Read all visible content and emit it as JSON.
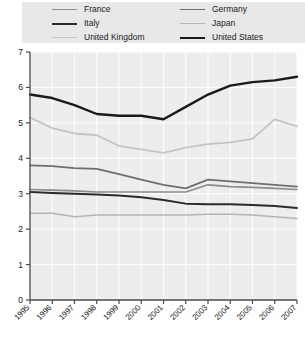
{
  "legend": {
    "columns": [
      [
        {
          "label": "France",
          "color": "#8c8c8c",
          "width": 1.6
        },
        {
          "label": "Italy",
          "color": "#2b2b2b",
          "width": 2.0
        },
        {
          "label": "United Kingdom",
          "color": "#c4c4c4",
          "width": 1.8
        }
      ],
      [
        {
          "label": "Germany",
          "color": "#6e6e6e",
          "width": 1.8
        },
        {
          "label": "Japan",
          "color": "#b5b5b5",
          "width": 1.6
        },
        {
          "label": "United States",
          "color": "#1a1a1a",
          "width": 2.4
        }
      ]
    ],
    "background": "#e8e8e8"
  },
  "axes": {
    "y_ticks": [
      "0",
      "1",
      "2",
      "3",
      "4",
      "5",
      "6",
      "7"
    ],
    "x_ticks": [
      "1995",
      "1996",
      "1997",
      "1998",
      "1999",
      "2000",
      "2001",
      "2002",
      "2003",
      "2004",
      "2005",
      "2006",
      "2007"
    ]
  },
  "chart_data": {
    "type": "line",
    "title": "",
    "xlabel": "",
    "ylabel": "",
    "ylim": [
      0,
      7
    ],
    "grid": true,
    "legend_position": "top",
    "plot_background": "#ededed",
    "grid_color": "#ffffff",
    "x": [
      "1995",
      "1996",
      "1997",
      "1998",
      "1999",
      "2000",
      "2001",
      "2002",
      "2003",
      "2004",
      "2005",
      "2006",
      "2007"
    ],
    "series": [
      {
        "name": "United States",
        "color": "#1a1a1a",
        "width": 2.4,
        "values": [
          5.8,
          5.7,
          5.5,
          5.25,
          5.2,
          5.2,
          5.1,
          5.45,
          5.8,
          6.05,
          6.15,
          6.2,
          6.3
        ]
      },
      {
        "name": "United Kingdom",
        "color": "#c4c4c4",
        "width": 1.8,
        "values": [
          5.15,
          4.85,
          4.7,
          4.65,
          4.35,
          4.25,
          4.15,
          4.3,
          4.4,
          4.45,
          4.55,
          5.1,
          4.9
        ]
      },
      {
        "name": "Germany",
        "color": "#6e6e6e",
        "width": 1.8,
        "values": [
          3.8,
          3.78,
          3.72,
          3.7,
          3.55,
          3.4,
          3.25,
          3.15,
          3.4,
          3.35,
          3.3,
          3.25,
          3.2
        ]
      },
      {
        "name": "France",
        "color": "#8c8c8c",
        "width": 1.6,
        "values": [
          3.12,
          3.1,
          3.08,
          3.05,
          3.05,
          3.05,
          3.05,
          3.05,
          3.25,
          3.2,
          3.18,
          3.15,
          3.12
        ]
      },
      {
        "name": "Italy",
        "color": "#2b2b2b",
        "width": 2.0,
        "values": [
          3.05,
          3.02,
          3.0,
          2.98,
          2.95,
          2.9,
          2.82,
          2.72,
          2.7,
          2.7,
          2.68,
          2.65,
          2.6
        ]
      },
      {
        "name": "Japan",
        "color": "#b5b5b5",
        "width": 1.6,
        "values": [
          2.45,
          2.45,
          2.35,
          2.4,
          2.4,
          2.4,
          2.4,
          2.4,
          2.42,
          2.42,
          2.4,
          2.35,
          2.3
        ]
      }
    ]
  }
}
